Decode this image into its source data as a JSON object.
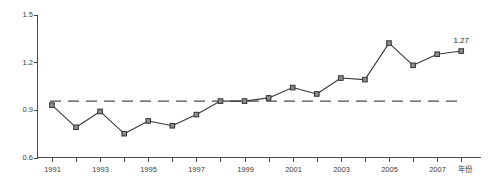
{
  "chart_data": {
    "type": "line",
    "title": "",
    "subtitle": "",
    "xlabel": "年份",
    "ylabel": "",
    "xlim": [
      1990.4,
      2008.8
    ],
    "ylim": [
      0.6,
      1.5
    ],
    "grid": false,
    "legend": "none",
    "x": [
      1991,
      1992,
      1993,
      1994,
      1995,
      1996,
      1997,
      1998,
      1999,
      2000,
      2001,
      2002,
      2003,
      2004,
      2005,
      2006,
      2007,
      2008
    ],
    "values": [
      0.93,
      0.79,
      0.89,
      0.75,
      0.83,
      0.8,
      0.87,
      0.955,
      0.955,
      0.975,
      1.04,
      1.0,
      1.1,
      1.09,
      1.32,
      1.18,
      1.25,
      1.27
    ],
    "series": [
      {
        "name": "series-1",
        "values": [
          0.93,
          0.79,
          0.89,
          0.75,
          0.83,
          0.8,
          0.87,
          0.955,
          0.955,
          0.975,
          1.04,
          1.0,
          1.1,
          1.09,
          1.32,
          1.18,
          1.25,
          1.27
        ],
        "marker": "square",
        "color": "#8d8d8d"
      }
    ],
    "reference_line": {
      "name": "reference-dashed-line",
      "value": 0.955,
      "style": "dashed",
      "x_start": 1991,
      "x_end": 2008
    },
    "y_ticks": [
      "0.6",
      "0.9",
      "1.2",
      "1.5"
    ],
    "y_tick_values": [
      0.6,
      0.9,
      1.2,
      1.5
    ],
    "x_ticks": [
      1991,
      1992,
      1993,
      1994,
      1995,
      1996,
      1997,
      1998,
      1999,
      2000,
      2001,
      2002,
      2003,
      2004,
      2005,
      2006,
      2007,
      2008
    ],
    "x_tick_labels": [
      "1991",
      "",
      "1993",
      "",
      "1995",
      "",
      "1997",
      "",
      "1999",
      "",
      "2001",
      "",
      "2003",
      "",
      "2005",
      "",
      "2007",
      ""
    ],
    "annotations": [
      {
        "name": "last-point-value-label",
        "text": "1.27",
        "x": 2008,
        "y": 1.27
      }
    ]
  },
  "axis": {
    "y_label_0": "0.6",
    "y_label_1": "0.9",
    "y_label_2": "1.2",
    "y_label_3": "1.5",
    "x_axis_title": "年份"
  },
  "labels": {
    "last_value": "1.27"
  }
}
